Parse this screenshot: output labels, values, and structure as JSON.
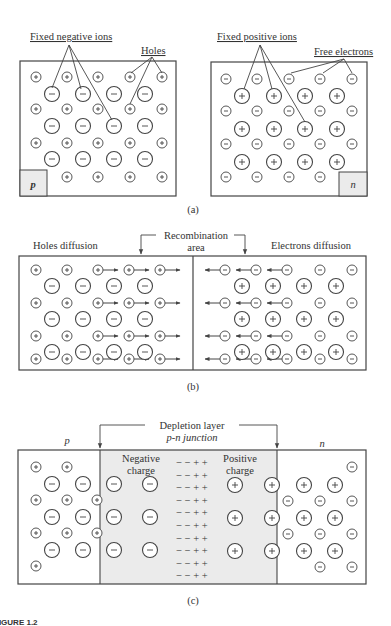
{
  "figure": {
    "caption_label": "FIGURE 1.2",
    "colors": {
      "stroke": "#444444",
      "shade": "#ebebeb",
      "text": "#333333",
      "background": "#ffffff"
    }
  },
  "panel_a": {
    "caption": "(a)",
    "p_type": {
      "region_label": "p",
      "labels": {
        "fixed_negative_ions": "Fixed negative ions",
        "holes": "Holes"
      },
      "small_symbol": "+",
      "large_symbol": "−"
    },
    "n_type": {
      "region_label": "n",
      "labels": {
        "fixed_positive_ions": "Fixed positive ions",
        "free_electrons": "Free electrons"
      },
      "small_symbol": "−",
      "large_symbol": "+"
    }
  },
  "panel_b": {
    "caption": "(b)",
    "labels": {
      "holes_diffusion": "Holes diffusion",
      "recombination_line1": "Recombination",
      "recombination_line2": "area",
      "electrons_diffusion": "Electrons diffusion"
    }
  },
  "panel_c": {
    "caption": "(c)",
    "labels": {
      "depletion_line1": "Depletion layer",
      "depletion_line2": "p-n junction",
      "p_label": "p",
      "n_label": "n",
      "negative_charge_line1": "Negative",
      "negative_charge_line2": "charge",
      "positive_charge_line1": "Positive",
      "positive_charge_line2": "charge",
      "charge_row": "− − + +"
    }
  }
}
